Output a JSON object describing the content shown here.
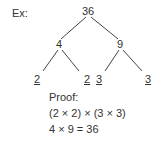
{
  "label": "Ex:",
  "tree": {
    "root": "36",
    "left": {
      "value": "4",
      "children": [
        "2",
        "2"
      ]
    },
    "right": {
      "value": "9",
      "children": [
        "3",
        "3"
      ]
    }
  },
  "proof": {
    "title": "Proof:",
    "line1": "(2 × 2) × (3 × 3)",
    "line2": "4 × 9 = 36"
  }
}
